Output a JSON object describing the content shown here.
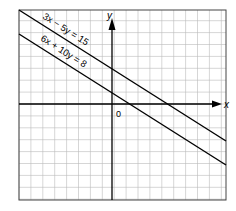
{
  "chart_data": {
    "type": "line",
    "title": "",
    "xlabel": "x",
    "ylabel": "y",
    "origin_label": "0",
    "grid": true,
    "xlim": [
      -8,
      9.5
    ],
    "ylim": [
      -8,
      8
    ],
    "series": [
      {
        "name": "3x − 5y = 15",
        "y_intercept": 3,
        "x_intercept": 5
      },
      {
        "name": "6x + 10y = 8",
        "y_intercept": 1,
        "x_intercept": 2
      }
    ]
  },
  "labels": {
    "line1": "3x − 5y = 15",
    "line2": "6x + 10y = 8",
    "x": "x",
    "y": "y",
    "origin": "0"
  }
}
